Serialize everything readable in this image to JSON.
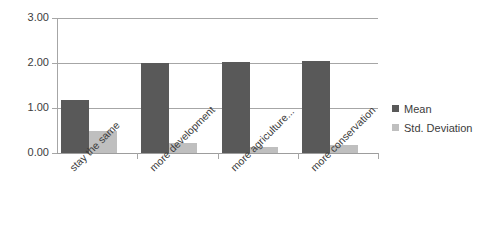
{
  "chart_data": {
    "type": "bar",
    "title": "",
    "subtitle": "",
    "xlabel": "",
    "ylabel": "",
    "ylim": [
      0,
      3
    ],
    "ytick_labels": [
      "0.00",
      "1.00",
      "2.00",
      "3.00"
    ],
    "ytick_values": [
      0,
      1,
      2,
      3
    ],
    "grid": true,
    "legend_position": "right",
    "categories": [
      "stay the same",
      "more development",
      "more agriculture...",
      "more conservation"
    ],
    "series": [
      {
        "name": "Mean",
        "color": "#595959",
        "values": [
          1.18,
          2.0,
          2.02,
          2.04
        ]
      },
      {
        "name": "Std. Deviation",
        "color": "#bfbfbf",
        "values": [
          0.49,
          0.22,
          0.13,
          0.18
        ]
      }
    ]
  },
  "axes": {
    "grid_color": "#a6a6a6",
    "tick_label_color": "#3c3c3c"
  },
  "legend": {
    "entries": [
      {
        "label": "Mean",
        "color": "#595959"
      },
      {
        "label": "Std. Deviation",
        "color": "#bfbfbf"
      }
    ]
  }
}
